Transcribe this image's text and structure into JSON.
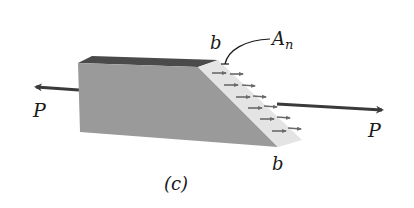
{
  "figure": {
    "caption": "(c)",
    "labels": {
      "load_left": "P",
      "load_right": "P",
      "edge_top": "b",
      "edge_bottom": "b",
      "area_base": "A",
      "area_sub": "n"
    },
    "colors": {
      "front_face": "#9a9a9a",
      "top_face": "#4a4a4a",
      "inclined_face": "#e4e4e4",
      "arrow": "#3a3a3a",
      "stress_arrow": "#6a6a6a"
    }
  }
}
